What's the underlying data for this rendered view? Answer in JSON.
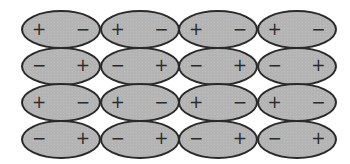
{
  "diagram": {
    "rows": 4,
    "columns": 4,
    "fill_color": "#b4b4b4",
    "outline_color": "#2a2a2a",
    "grid": [
      [
        {
          "left": "+",
          "right": "−"
        },
        {
          "left": "+",
          "right": "−"
        },
        {
          "left": "+",
          "right": "−"
        },
        {
          "left": "+",
          "right": "−"
        }
      ],
      [
        {
          "left": "−",
          "right": "+"
        },
        {
          "left": "−",
          "right": "+"
        },
        {
          "left": "−",
          "right": "+"
        },
        {
          "left": "−",
          "right": "+"
        }
      ],
      [
        {
          "left": "+",
          "right": "−"
        },
        {
          "left": "+",
          "right": "−"
        },
        {
          "left": "+",
          "right": "−"
        },
        {
          "left": "+",
          "right": "−"
        }
      ],
      [
        {
          "left": "−",
          "right": "+"
        },
        {
          "left": "−",
          "right": "+"
        },
        {
          "left": "−",
          "right": "+"
        },
        {
          "left": "−",
          "right": "+"
        }
      ]
    ]
  }
}
